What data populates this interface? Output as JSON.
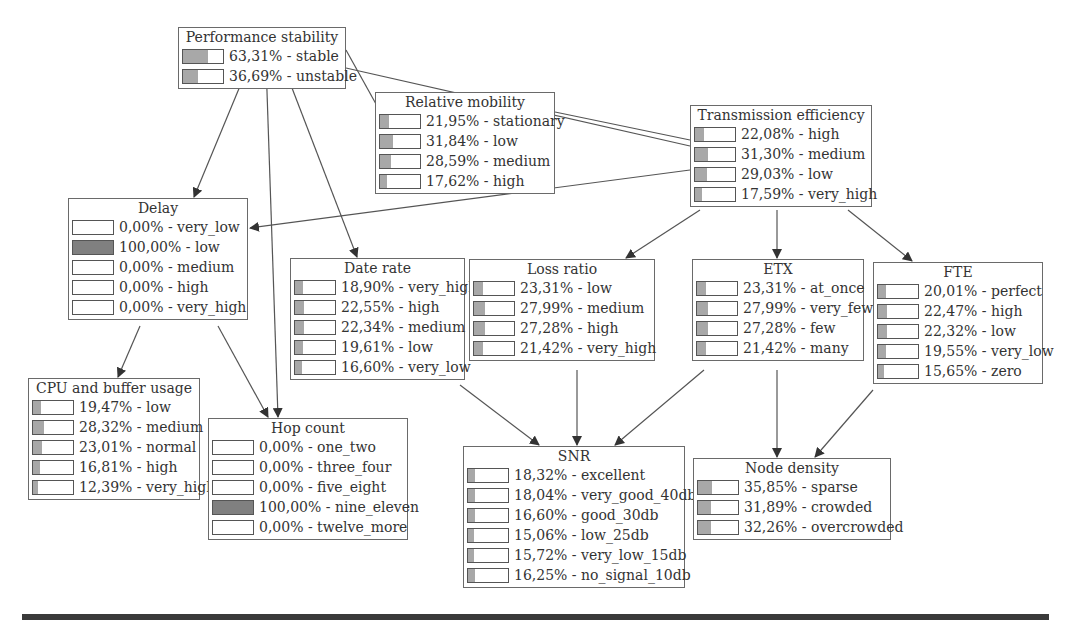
{
  "diagram": {
    "type": "bayesian-network",
    "nodes": [
      {
        "id": "performance_stability",
        "title": "Performance stability",
        "x": 178,
        "y": 27,
        "w": 168,
        "states": [
          {
            "label": "63,31% - stable",
            "pct": 63.31
          },
          {
            "label": "36,69% - unstable",
            "pct": 36.69
          }
        ]
      },
      {
        "id": "relative_mobility",
        "title": "Relative mobility",
        "x": 375,
        "y": 92,
        "w": 180,
        "states": [
          {
            "label": "21,95% - stationary",
            "pct": 21.95
          },
          {
            "label": "31,84% - low",
            "pct": 31.84
          },
          {
            "label": "28,59% - medium",
            "pct": 28.59
          },
          {
            "label": "17,62% - high",
            "pct": 17.62
          }
        ]
      },
      {
        "id": "transmission_efficiency",
        "title": "Transmission efficiency",
        "x": 690,
        "y": 105,
        "w": 182,
        "states": [
          {
            "label": "22,08% - high",
            "pct": 22.08
          },
          {
            "label": "31,30% - medium",
            "pct": 31.3
          },
          {
            "label": "29,03% - low",
            "pct": 29.03
          },
          {
            "label": "17,59% - very_high",
            "pct": 17.59
          }
        ]
      },
      {
        "id": "delay",
        "title": "Delay",
        "x": 68,
        "y": 198,
        "w": 180,
        "states": [
          {
            "label": "0,00% - very_low",
            "pct": 0
          },
          {
            "label": "100,00% - low",
            "pct": 100
          },
          {
            "label": "0,00% - medium",
            "pct": 0
          },
          {
            "label": "0,00% - high",
            "pct": 0
          },
          {
            "label": "0,00% - very_high",
            "pct": 0
          }
        ]
      },
      {
        "id": "date_rate",
        "title": "Date rate",
        "x": 290,
        "y": 258,
        "w": 175,
        "states": [
          {
            "label": "18,90% - very_high",
            "pct": 18.9
          },
          {
            "label": "22,55% - high",
            "pct": 22.55
          },
          {
            "label": "22,34% - medium",
            "pct": 22.34
          },
          {
            "label": "19,61% - low",
            "pct": 19.61
          },
          {
            "label": "16,60% - very_low",
            "pct": 16.6
          }
        ]
      },
      {
        "id": "loss_ratio",
        "title": "Loss ratio",
        "x": 469,
        "y": 259,
        "w": 186,
        "states": [
          {
            "label": "23,31% - low",
            "pct": 23.31
          },
          {
            "label": "27,99% - medium",
            "pct": 27.99
          },
          {
            "label": "27,28% - high",
            "pct": 27.28
          },
          {
            "label": "21,42% - very_high",
            "pct": 21.42
          }
        ]
      },
      {
        "id": "etx",
        "title": "ETX",
        "x": 692,
        "y": 259,
        "w": 172,
        "states": [
          {
            "label": "23,31% - at_once",
            "pct": 23.31
          },
          {
            "label": "27,99% - very_few",
            "pct": 27.99
          },
          {
            "label": "27,28% - few",
            "pct": 27.28
          },
          {
            "label": "21,42% - many",
            "pct": 21.42
          }
        ]
      },
      {
        "id": "fte",
        "title": "FTE",
        "x": 873,
        "y": 262,
        "w": 170,
        "states": [
          {
            "label": "20,01% - perfect",
            "pct": 20.01
          },
          {
            "label": "22,47% - high",
            "pct": 22.47
          },
          {
            "label": "22,32% - low",
            "pct": 22.32
          },
          {
            "label": "19,55% - very_low",
            "pct": 19.55
          },
          {
            "label": "15,65% - zero",
            "pct": 15.65
          }
        ]
      },
      {
        "id": "cpu_buffer_usage",
        "title": "CPU and buffer usage",
        "x": 28,
        "y": 378,
        "w": 172,
        "states": [
          {
            "label": "19,47% - low",
            "pct": 19.47
          },
          {
            "label": "28,32% - medium",
            "pct": 28.32
          },
          {
            "label": "23,01% - normal",
            "pct": 23.01
          },
          {
            "label": "16,81% - high",
            "pct": 16.81
          },
          {
            "label": "12,39% - very_high",
            "pct": 12.39
          }
        ]
      },
      {
        "id": "hop_count",
        "title": "Hop count",
        "x": 208,
        "y": 418,
        "w": 200,
        "states": [
          {
            "label": "0,00% - one_two",
            "pct": 0
          },
          {
            "label": "0,00% - three_four",
            "pct": 0
          },
          {
            "label": "0,00% - five_eight",
            "pct": 0
          },
          {
            "label": "100,00% - nine_eleven",
            "pct": 100
          },
          {
            "label": "0,00% - twelve_more",
            "pct": 0
          }
        ]
      },
      {
        "id": "snr",
        "title": "SNR",
        "x": 463,
        "y": 446,
        "w": 222,
        "states": [
          {
            "label": "18,32% - excellent",
            "pct": 18.32
          },
          {
            "label": "18,04% - very_good_40db",
            "pct": 18.04
          },
          {
            "label": "16,60% - good_30db",
            "pct": 16.6
          },
          {
            "label": "15,06% - low_25db",
            "pct": 15.06
          },
          {
            "label": "15,72% - very_low_15db",
            "pct": 15.72
          },
          {
            "label": "16,25% - no_signal_10db",
            "pct": 16.25
          }
        ]
      },
      {
        "id": "node_density",
        "title": "Node density",
        "x": 693,
        "y": 458,
        "w": 198,
        "states": [
          {
            "label": "35,85% - sparse",
            "pct": 35.85
          },
          {
            "label": "31,89% - crowded",
            "pct": 31.89
          },
          {
            "label": "32,26% - overcrowded",
            "pct": 32.26
          }
        ]
      }
    ],
    "edges": [
      {
        "from": "performance_stability",
        "to": "delay",
        "points": [
          [
            250,
            62
          ],
          [
            194,
            197
          ]
        ]
      },
      {
        "from": "performance_stability",
        "to": "hop_count",
        "points": [
          [
            266,
            62
          ],
          [
            278,
            417
          ]
        ]
      },
      {
        "from": "performance_stability",
        "to": "date_rate",
        "points": [
          [
            282,
            62
          ],
          [
            357,
            257
          ]
        ]
      },
      {
        "from": "performance_stability",
        "to": "relative_mobility",
        "points": [
          [
            346,
            50
          ],
          [
            376,
            104
          ]
        ],
        "arrow": false
      },
      {
        "from": "performance_stability",
        "to": "transmission_efficiency",
        "points": [
          [
            346,
            68
          ],
          [
            690,
            146
          ]
        ],
        "arrow": false
      },
      {
        "from": "relative_mobility",
        "to": "transmission_efficiency",
        "points": [
          [
            555,
            112
          ],
          [
            690,
            140
          ]
        ],
        "arrow": false
      },
      {
        "from": "transmission_efficiency",
        "to": "delay",
        "points": [
          [
            690,
            170
          ],
          [
            250,
            228
          ]
        ]
      },
      {
        "from": "transmission_efficiency",
        "to": "loss_ratio",
        "points": [
          [
            700,
            210
          ],
          [
            626,
            258
          ]
        ]
      },
      {
        "from": "transmission_efficiency",
        "to": "etx",
        "points": [
          [
            777,
            210
          ],
          [
            777,
            258
          ]
        ]
      },
      {
        "from": "transmission_efficiency",
        "to": "fte",
        "points": [
          [
            848,
            210
          ],
          [
            912,
            261
          ]
        ]
      },
      {
        "from": "delay",
        "to": "cpu_buffer_usage",
        "points": [
          [
            140,
            326
          ],
          [
            118,
            377
          ]
        ]
      },
      {
        "from": "delay",
        "to": "hop_count",
        "points": [
          [
            218,
            326
          ],
          [
            268,
            417
          ]
        ]
      },
      {
        "from": "date_rate",
        "to": "snr",
        "points": [
          [
            460,
            385
          ],
          [
            539,
            445
          ]
        ]
      },
      {
        "from": "loss_ratio",
        "to": "snr",
        "points": [
          [
            577,
            370
          ],
          [
            577,
            445
          ]
        ]
      },
      {
        "from": "etx",
        "to": "snr",
        "points": [
          [
            704,
            370
          ],
          [
            615,
            445
          ]
        ]
      },
      {
        "from": "etx",
        "to": "node_density",
        "points": [
          [
            777,
            370
          ],
          [
            777,
            457
          ]
        ]
      },
      {
        "from": "fte",
        "to": "node_density",
        "points": [
          [
            873,
            390
          ],
          [
            815,
            457
          ]
        ]
      }
    ],
    "colors": {
      "node_border": "#6a6a6a",
      "bar_fill": "#a8a8a8",
      "bar_full": "#808080",
      "edge": "#555555",
      "text": "#333333",
      "bottom_rule": "#3a3a3a"
    }
  }
}
